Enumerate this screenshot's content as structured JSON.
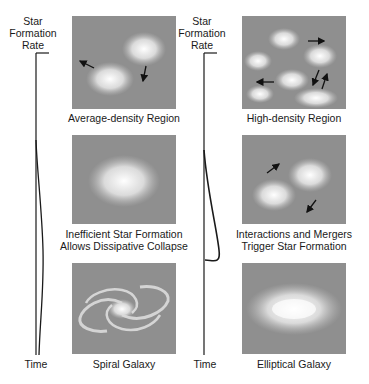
{
  "left_column": {
    "axis": {
      "y_label_lines": [
        "Star",
        "Formation",
        "Rate"
      ],
      "x_label": "Time"
    },
    "curve": "low, gradually rising broad star formation rate over time",
    "panels": [
      {
        "caption_lines": [
          "Average-density Region"
        ],
        "scene": "two gas clouds drifting apart with arrows"
      },
      {
        "caption_lines": [
          "Inefficient Star Formation",
          "Allows Dissipative Collapse"
        ],
        "scene": "single diffuse cloud collapsing"
      },
      {
        "caption_lines": [
          "Spiral Galaxy"
        ],
        "scene": "two-armed spiral galaxy"
      }
    ]
  },
  "right_column": {
    "axis": {
      "y_label_lines": [
        "Star",
        "Formation",
        "Rate"
      ],
      "x_label": "Time"
    },
    "curve": "sharp burst of star formation then drop to zero",
    "panels": [
      {
        "caption_lines": [
          "High-density Region"
        ],
        "scene": "many gas clouds moving with arrows"
      },
      {
        "caption_lines": [
          "Interactions and Mergers",
          "Trigger Star Formation"
        ],
        "scene": "two clouds approaching, arrows"
      },
      {
        "caption_lines": [
          "Elliptical Galaxy"
        ],
        "scene": "smooth elliptical galaxy"
      }
    ]
  },
  "colors": {
    "panel_bg": "#8f8f8f",
    "cloud": "#f2f2f2",
    "line": "#1a1a1a"
  }
}
